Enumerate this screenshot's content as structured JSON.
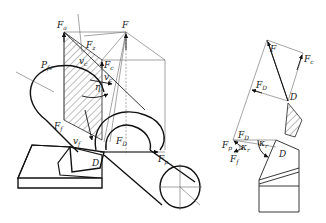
{
  "figure": {
    "left_view": {
      "name": "3D view",
      "labels": {
        "Fa": {
          "main": "F",
          "sub": "a"
        },
        "F": {
          "main": "F",
          "sub": ""
        },
        "Fz": {
          "main": "F",
          "sub": "z"
        },
        "Pfe": {
          "main": "P",
          "sub": "fe"
        },
        "vc": {
          "main": "v",
          "sub": "c"
        },
        "Fc": {
          "main": "F",
          "sub": "c"
        },
        "vc2": {
          "main": "v",
          "sub": "c"
        },
        "eta": {
          "main": "η",
          "sub": ""
        },
        "Ff": {
          "main": "F",
          "sub": "f"
        },
        "vf": {
          "main": "v",
          "sub": "f"
        },
        "D": {
          "main": "D",
          "sub": ""
        },
        "FD": {
          "main": "F",
          "sub": "D"
        },
        "Fp": {
          "main": "F",
          "sub": "p"
        }
      }
    },
    "right_view": {
      "name": "plan view",
      "labels": {
        "F": {
          "main": "F",
          "sub": ""
        },
        "Fc": {
          "main": "F",
          "sub": "c"
        },
        "FD_top": {
          "main": "F",
          "sub": "D"
        },
        "D_top": {
          "main": "D",
          "sub": ""
        },
        "FD_bottom": {
          "main": "F",
          "sub": "D"
        },
        "Fp": {
          "main": "F",
          "sub": "p"
        },
        "kr1": {
          "main": "κ",
          "sub": "r"
        },
        "kr2": {
          "main": "κ",
          "sub": "r"
        },
        "Ff": {
          "main": "F",
          "sub": "f"
        },
        "D_bottom": {
          "main": "D",
          "sub": ""
        }
      }
    }
  }
}
